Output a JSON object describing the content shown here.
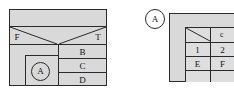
{
  "figure": {
    "background_color": "#ffffff",
    "fill_color": "#d9d9d9",
    "line_color": "#2a2a2a",
    "width": 234,
    "height": 94
  },
  "left_diagram": {
    "name": "left-block-diagram",
    "top_strip": {
      "label": ""
    },
    "funnel_row": {
      "left_label": "F",
      "right_label": "T"
    },
    "stacked_cells": [
      {
        "label": "B"
      },
      {
        "label": "C"
      },
      {
        "label": "D"
      }
    ],
    "callout": {
      "label": "A"
    }
  },
  "right_diagram": {
    "name": "right-block-diagram",
    "callout": {
      "label": "A"
    },
    "corner_label": "c",
    "grid_rows": [
      {
        "cells": [
          {
            "label": "1"
          },
          {
            "label": "2"
          }
        ]
      },
      {
        "cells": [
          {
            "label": "E"
          },
          {
            "label": "F"
          }
        ]
      }
    ]
  }
}
